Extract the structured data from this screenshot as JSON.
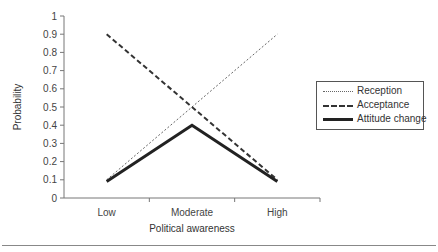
{
  "chart_data": {
    "type": "line",
    "title": "",
    "xlabel": "Political awareness",
    "ylabel": "Probability",
    "categories": [
      "Low",
      "Moderate",
      "High"
    ],
    "series": [
      {
        "name": "Reception",
        "values": [
          0.1,
          0.5,
          0.9
        ],
        "style": "dotted"
      },
      {
        "name": "Acceptance",
        "values": [
          0.9,
          0.5,
          0.1
        ],
        "style": "dashed"
      },
      {
        "name": "Attitude change",
        "values": [
          0.09,
          0.4,
          0.09
        ],
        "style": "solid-thick"
      }
    ],
    "ylim": [
      0,
      1
    ],
    "yticks": [
      "0",
      "0.1",
      "0.2",
      "0.3",
      "0.4",
      "0.5",
      "0.6",
      "0.7",
      "0.8",
      "0.9",
      "1"
    ],
    "grid": false,
    "legend_position": "right"
  },
  "legend": {
    "items": [
      {
        "label": "Reception"
      },
      {
        "label": "Acceptance"
      },
      {
        "label": "Attitude change"
      }
    ]
  },
  "axes": {
    "x_title": "Political awareness",
    "y_title": "Probability",
    "x_labels": [
      "Low",
      "Moderate",
      "High"
    ]
  },
  "colors": {
    "axis": "#777777",
    "reception": "#666666",
    "acceptance": "#333333",
    "attitude": "#222222"
  }
}
